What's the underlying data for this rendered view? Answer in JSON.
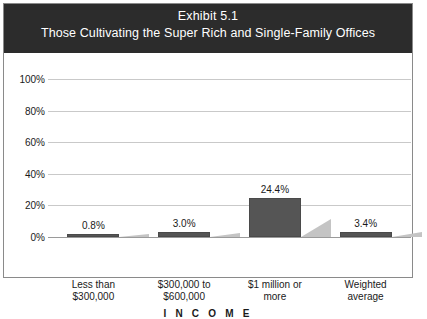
{
  "exhibit": {
    "title_line1": "Exhibit 5.1",
    "title_line2": "Those Cultivating the Super Rich and Single-Family Offices",
    "band_color": "#2c2c2c",
    "band_text_color": "#ffffff"
  },
  "chart_data": {
    "type": "bar",
    "title": "Exhibit 5.1",
    "subtitle": "Those Cultivating the Super Rich and Single-Family Offices",
    "xlabel": "I N C O M E",
    "ylabel": "",
    "categories": [
      "Less than $300,000",
      "$300,000 to $600,000",
      "$1 million or more",
      "Weighted average"
    ],
    "category_lines": [
      [
        "Less than",
        "$300,000"
      ],
      [
        "$300,000 to",
        "$600,000"
      ],
      [
        "$1 million or",
        "more"
      ],
      [
        "Weighted",
        "average"
      ]
    ],
    "values": [
      0.8,
      3.0,
      24.4,
      3.4
    ],
    "value_labels": [
      "0.8%",
      "3.0%",
      "24.4%",
      "3.4%"
    ],
    "ylim": [
      0,
      100
    ],
    "yticks": [
      0,
      20,
      40,
      60,
      80,
      100
    ],
    "ytick_labels": [
      "0%",
      "20%",
      "40%",
      "60%",
      "80%",
      "100%"
    ],
    "grid": true,
    "legend": "none",
    "bar_color": "#555555",
    "shadow_color": "#c4c4c4",
    "gridline_color": "#c9c9c9",
    "baseline_color": "#9a9a9a"
  }
}
